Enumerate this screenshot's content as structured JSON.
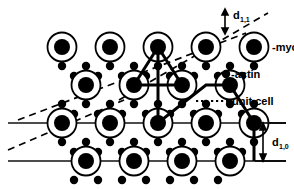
{
  "figure": {
    "kind": "crystal-lattice-diagram",
    "background_color": "#ffffff",
    "ink_color": "#000000",
    "width": 294,
    "height": 190
  },
  "labels": {
    "myosin": "-myosin",
    "actin": "-actin",
    "unit_cell": "unit cell",
    "d11_base": "d",
    "d11_sub": "1,1",
    "d10_base": "d",
    "d10_sub": "1,0"
  },
  "legend": [
    {
      "key": "myosin",
      "text": "-myosin",
      "marker": "ring-with-filled-core",
      "x": 247,
      "y": 47
    },
    {
      "key": "actin",
      "text": "-actin",
      "marker": "small-filled-dot",
      "x": 231,
      "y": 74
    }
  ],
  "annotations": [
    {
      "key": "unit-cell",
      "text": "unit cell",
      "leader": "dotted",
      "x": 232,
      "y": 101
    },
    {
      "key": "d11",
      "text": "d1,1",
      "arrow": "double-headed-vertical",
      "x": 233,
      "y": 17
    },
    {
      "key": "d10",
      "text": "d1,0",
      "arrow": "double-headed-vertical",
      "x": 272,
      "y": 143
    }
  ],
  "lattice": {
    "myosin_radius_outer": 14.5,
    "myosin_radius_inner": 8.0,
    "actin_radius": 4.2,
    "row_spacing": 38,
    "col_spacing": 47,
    "myosin_rows": [
      {
        "row": 0,
        "y": 47,
        "xs": [
          62,
          110,
          158,
          206,
          254
        ]
      },
      {
        "row": 1,
        "y": 85,
        "xs": [
          86,
          134,
          182,
          230
        ]
      },
      {
        "row": 2,
        "y": 123,
        "xs": [
          62,
          110,
          158,
          206,
          254
        ]
      },
      {
        "row": 3,
        "y": 161,
        "xs": [
          86,
          134,
          182,
          230
        ]
      }
    ],
    "actin_rows": [
      {
        "y": 66,
        "xs": [
          62,
          86,
          110,
          134,
          158,
          182,
          206,
          230,
          254
        ]
      },
      {
        "y": 76,
        "xs": [
          74,
          98,
          122,
          146,
          170,
          194,
          218,
          242
        ]
      },
      {
        "y": 104,
        "xs": [
          62,
          86,
          110,
          134,
          158,
          182,
          206,
          230,
          254
        ]
      },
      {
        "y": 114,
        "xs": [
          74,
          98,
          122,
          146,
          170,
          194,
          218,
          242
        ]
      },
      {
        "y": 142,
        "xs": [
          62,
          86,
          110,
          134,
          158,
          182,
          206,
          230,
          254
        ]
      },
      {
        "y": 152,
        "xs": [
          74,
          98,
          122,
          146,
          170,
          194,
          218,
          242
        ]
      },
      {
        "y": 180,
        "xs": [
          74,
          98,
          122,
          146,
          170,
          194,
          218
        ]
      }
    ]
  },
  "lattice_lines": {
    "solid_horizontal": [
      {
        "name": "d10-plane-upper",
        "y": 123,
        "x1": 8,
        "x2": 286
      },
      {
        "name": "d10-plane-lower",
        "y": 161,
        "x1": 8,
        "x2": 286
      }
    ],
    "dashed_oblique": [
      {
        "name": "d11-plane-upper",
        "x1": 119,
        "y1": 100,
        "x2": 264,
        "y2": 15
      },
      {
        "name": "d11-plane-middle",
        "x1": 20,
        "y1": 119,
        "x2": 240,
        "y2": 36
      },
      {
        "name": "d11-plane-lower",
        "x1": 8,
        "y1": 148,
        "x2": 120,
        "y2": 102
      }
    ]
  },
  "unit_cell_path": {
    "stroke_width": 3,
    "points": [
      [
        158,
        47
      ],
      [
        134,
        85
      ],
      [
        182,
        85
      ],
      [
        158,
        47
      ],
      [
        158,
        123
      ],
      [
        206,
        85
      ],
      [
        230,
        85
      ],
      [
        254,
        123
      ],
      [
        254,
        161
      ]
    ]
  },
  "colors": {
    "ink": "#000000",
    "paper": "#ffffff",
    "rule": "#1a1a1a"
  }
}
